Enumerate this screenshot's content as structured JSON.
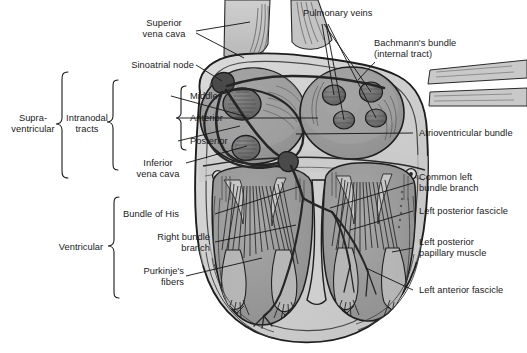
{
  "figure": {
    "style": "grayscale medical line illustration",
    "background_color": "#ffffff",
    "line_color": "#1a1a1a",
    "tissue_light": "#d2d2d2",
    "tissue_mid": "#b4b4b4",
    "tissue_dark": "#8e8e8e",
    "chamber_fill": "#9a9a9a",
    "node_fill": "#6e6e6e"
  },
  "group_braces": [
    {
      "name": "supraventricular",
      "label": "Supra-\nventricular",
      "label_line1": "Supra-",
      "label_line2": "ventricular"
    },
    {
      "name": "intranodal-tracts",
      "label_line1": "Intranodal",
      "label_line2": "tracts"
    },
    {
      "name": "intranodal-subgroup",
      "label": ""
    },
    {
      "name": "ventricular",
      "label_line1": "Ventricular",
      "label_line2": ""
    }
  ],
  "labels_left": [
    {
      "id": "superior-vena-cava",
      "line1": "Superior",
      "line2": "vena cava"
    },
    {
      "id": "sinoatrial-node",
      "line1": "Sinoatrial node",
      "line2": ""
    },
    {
      "id": "middle",
      "line1": "Middle",
      "line2": ""
    },
    {
      "id": "anterior",
      "line1": "Anterior",
      "line2": ""
    },
    {
      "id": "posterior",
      "line1": "Posterior",
      "line2": ""
    },
    {
      "id": "inferior-vena-cava",
      "line1": "Inferior",
      "line2": "vena cava"
    },
    {
      "id": "bundle-of-his",
      "line1": "Bundle of His",
      "line2": ""
    },
    {
      "id": "right-bundle-branch",
      "line1": "Right bundle",
      "line2": "branch"
    },
    {
      "id": "purkinjes-fibers",
      "line1": "Purkinje's",
      "line2": "fibers"
    }
  ],
  "labels_right": [
    {
      "id": "pulmonary-veins",
      "line1": "Pulmonary veins",
      "line2": ""
    },
    {
      "id": "bachmanns-bundle",
      "line1": "Bachmann's bundle",
      "line2": "(internal tract)"
    },
    {
      "id": "atrioventricular-bundle",
      "line1": "Atrioventricular bundle",
      "line2": ""
    },
    {
      "id": "common-left-bundle-branch",
      "line1": "Common left",
      "line2": "bundle branch"
    },
    {
      "id": "left-posterior-fascicle",
      "line1": "Left posterior fascicle",
      "line2": ""
    },
    {
      "id": "left-posterior-papillary-muscle",
      "line1": "Left posterior",
      "line2": "papillary muscle"
    },
    {
      "id": "left-anterior-fascicle",
      "line1": "Left anterior fascicle",
      "line2": ""
    }
  ],
  "text": {
    "supra_l1": "Supra-",
    "supra_l2": "ventricular",
    "intranodal_l1": "Intranodal",
    "intranodal_l2": "tracts",
    "ventricular": "Ventricular",
    "svc_l1": "Superior",
    "svc_l2": "vena cava",
    "san": "Sinoatrial node",
    "middle": "Middle",
    "anterior": "Anterior",
    "posterior": "Posterior",
    "ivc_l1": "Inferior",
    "ivc_l2": "vena cava",
    "his": "Bundle of His",
    "rbb_l1": "Right bundle",
    "rbb_l2": "branch",
    "purk_l1": "Purkinje's",
    "purk_l2": "fibers",
    "pulm_veins": "Pulmonary veins",
    "bach_l1": "Bachmann's bundle",
    "bach_l2": "(internal tract)",
    "av_bundle": "Atrioventricular bundle",
    "clbb_l1": "Common left",
    "clbb_l2": "bundle branch",
    "lpf": "Left posterior fascicle",
    "lppm_l1": "Left posterior",
    "lppm_l2": "papillary muscle",
    "laf": "Left anterior fascicle"
  }
}
